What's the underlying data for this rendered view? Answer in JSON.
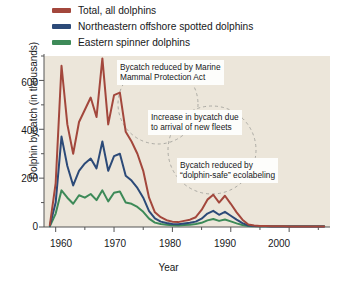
{
  "chart_data": {
    "type": "line",
    "title": "",
    "xlabel": "Year",
    "ylabel": "Dolphin bycatch (in thousands)",
    "xlim": [
      1958,
      2007
    ],
    "ylim": [
      0,
      700
    ],
    "xticks": [
      1960,
      1970,
      1980,
      1990,
      2000
    ],
    "xticks_minor": [
      1965,
      1975,
      1985,
      1995,
      2005
    ],
    "yticks": [
      0,
      200,
      400,
      600
    ],
    "yticks_minor": [
      100,
      300,
      500,
      700
    ],
    "grid": false,
    "legend_position": "above-plot",
    "plot_background": "#ece6da",
    "series": [
      {
        "name": "Total, all dolphins",
        "color": "#a3473c",
        "x": [
          1959,
          1960,
          1961,
          1962,
          1963,
          1964,
          1965,
          1966,
          1967,
          1968,
          1969,
          1970,
          1971,
          1972,
          1973,
          1974,
          1975,
          1976,
          1977,
          1978,
          1979,
          1980,
          1981,
          1982,
          1983,
          1984,
          1985,
          1986,
          1987,
          1988,
          1989,
          1990,
          1991,
          1992,
          1993,
          1994,
          1995,
          1996,
          1997,
          1998,
          1999,
          2000,
          2001,
          2002,
          2003,
          2004,
          2005,
          2006
        ],
        "values": [
          8,
          180,
          660,
          420,
          300,
          430,
          480,
          530,
          450,
          690,
          420,
          540,
          550,
          390,
          350,
          300,
          230,
          120,
          60,
          40,
          28,
          22,
          20,
          25,
          30,
          40,
          70,
          112,
          132,
          100,
          128,
          95,
          60,
          30,
          10,
          6,
          4,
          4,
          3,
          3,
          3,
          2,
          2,
          2,
          2,
          2,
          2,
          2
        ]
      },
      {
        "name": "Northeastern offshore spotted dolphins",
        "color": "#2c4a78",
        "x": [
          1959,
          1960,
          1961,
          1962,
          1963,
          1964,
          1965,
          1966,
          1967,
          1968,
          1969,
          1970,
          1971,
          1972,
          1973,
          1974,
          1975,
          1976,
          1977,
          1978,
          1979,
          1980,
          1981,
          1982,
          1983,
          1984,
          1985,
          1986,
          1987,
          1988,
          1989,
          1990,
          1991,
          1992,
          1993,
          1994,
          1995,
          1996,
          1997,
          1998,
          1999,
          2000,
          2001,
          2002,
          2003,
          2004,
          2005,
          2006
        ],
        "values": [
          5,
          100,
          370,
          250,
          170,
          230,
          260,
          280,
          240,
          350,
          230,
          290,
          300,
          210,
          190,
          160,
          120,
          65,
          35,
          22,
          16,
          12,
          11,
          14,
          17,
          22,
          34,
          55,
          66,
          50,
          62,
          46,
          30,
          16,
          6,
          4,
          3,
          3,
          2,
          2,
          2,
          2,
          2,
          2,
          2,
          2,
          2,
          2
        ]
      },
      {
        "name": "Eastern spinner dolphins",
        "color": "#3d8a58",
        "x": [
          1959,
          1960,
          1961,
          1962,
          1963,
          1964,
          1965,
          1966,
          1967,
          1968,
          1969,
          1970,
          1971,
          1972,
          1973,
          1974,
          1975,
          1976,
          1977,
          1978,
          1979,
          1980,
          1981,
          1982,
          1983,
          1984,
          1985,
          1986,
          1987,
          1988,
          1989,
          1990,
          1991,
          1992,
          1993,
          1994,
          1995,
          1996,
          1997,
          1998,
          1999,
          2000,
          2001,
          2002,
          2003,
          2004,
          2005,
          2006
        ],
        "values": [
          3,
          55,
          150,
          120,
          95,
          130,
          120,
          135,
          110,
          150,
          105,
          140,
          145,
          100,
          95,
          82,
          62,
          34,
          18,
          12,
          9,
          7,
          6,
          8,
          9,
          12,
          17,
          27,
          33,
          25,
          31,
          23,
          15,
          8,
          4,
          3,
          3,
          3,
          3,
          3,
          3,
          3,
          3,
          3,
          3,
          3,
          3,
          3
        ]
      }
    ],
    "annotations": [
      {
        "id": "mmpa",
        "text_lines": [
          "Bycatch reduced by Marine",
          "Mammal Protection Act"
        ]
      },
      {
        "id": "fleets",
        "text_lines": [
          "Increase in bycatch due",
          "to arrival of new fleets"
        ]
      },
      {
        "id": "ecolabel",
        "text_lines": [
          "Bycatch reduced by",
          "“dolphin-safe” ecolabeling"
        ]
      }
    ]
  },
  "legend": {
    "items": [
      {
        "label": "Total, all dolphins",
        "color": "#a3473c"
      },
      {
        "label": "Northeastern offshore spotted dolphins",
        "color": "#2c4a78"
      },
      {
        "label": "Eastern spinner dolphins",
        "color": "#3d8a58"
      }
    ]
  },
  "axes": {
    "x_title": "Year",
    "y_title": "Dolphin bycatch (in thousands)",
    "x_tick_labels": [
      "1960",
      "1970",
      "1980",
      "1990",
      "2000"
    ],
    "y_tick_labels": [
      "600",
      "400",
      "200",
      "0"
    ]
  },
  "callouts": {
    "mmpa_line1": "Bycatch reduced by Marine",
    "mmpa_line2": "Mammal Protection Act",
    "fleets_line1": "Increase in bycatch due",
    "fleets_line2": "to arrival of new fleets",
    "eco_line1": "Bycatch reduced by",
    "eco_line2": "“dolphin-safe” ecolabeling"
  }
}
